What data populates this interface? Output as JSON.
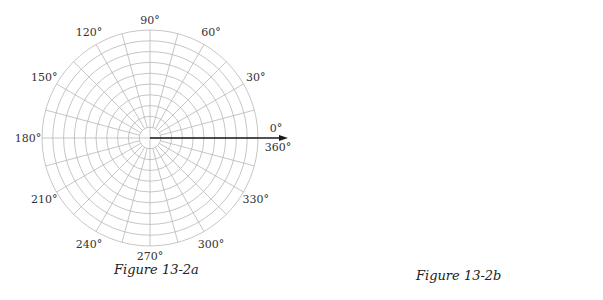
{
  "chart_data": [
    {
      "id": "fig-a",
      "type": "polar-line",
      "title": "Figure 13-2a",
      "center_px": [
        150,
        138
      ],
      "px_per_unit": 10.8,
      "rings": 10,
      "radial_step_deg": 15,
      "angle_labels": [
        "0°",
        "30°",
        "60°",
        "90°",
        "120°",
        "150°",
        "180°",
        "210°",
        "240°",
        "270°",
        "300°",
        "330°",
        "360°"
      ],
      "grid": true,
      "arrow_axis": "polar axis (0°)",
      "series": [
        {
          "name": "r = 10cos(theta)",
          "formula": "10*cos(t)",
          "a": 10,
          "kind": "circle",
          "points_deg": [
            0,
            15,
            30,
            45,
            60,
            75,
            90,
            285,
            300,
            315,
            330,
            345
          ],
          "r_values": [
            10,
            9.66,
            8.66,
            7.07,
            5.0,
            2.59,
            0,
            2.59,
            5.0,
            7.07,
            8.66,
            9.66
          ]
        },
        {
          "name": "r = 6cos(theta)",
          "formula": "6*cos(t)",
          "a": 6,
          "kind": "circle",
          "points_deg": [
            0,
            15,
            30,
            45,
            60,
            75,
            90,
            285,
            300,
            315,
            330,
            345
          ],
          "r_values": [
            6,
            5.8,
            5.2,
            4.24,
            3.0,
            1.55,
            0,
            1.55,
            3.0,
            4.24,
            5.2,
            5.8
          ]
        }
      ]
    },
    {
      "id": "fig-b",
      "type": "polar-line",
      "title": "Figure 13-2b",
      "center_px": [
        152,
        141
      ],
      "px_per_unit": 10.8,
      "rings": 10,
      "radial_step_deg": 15,
      "angle_labels": [
        "0°",
        "30°",
        "60°",
        "90°",
        "120°",
        "150°",
        "180°",
        "210°",
        "240°",
        "270°",
        "300°",
        "330°",
        "360°"
      ],
      "grid": true,
      "arrow_axis": "polar axis (0°)",
      "series": [
        {
          "name": "r = 9/(5 - 4cos(theta))",
          "formula": "9/(5-4*cos(t))",
          "kind": "ellipse",
          "points_deg": [
            0,
            15,
            30,
            45,
            60,
            75,
            90,
            105,
            120,
            135,
            150,
            165,
            180,
            195,
            210,
            225,
            240,
            255,
            270,
            285,
            300,
            315,
            330,
            345
          ],
          "r_values": [
            9.0,
            7.12,
            4.78,
            3.19,
            2.25,
            1.7,
            1.8,
            1.49,
            1.29,
            1.15,
            1.06,
            1.01,
            1.0,
            1.01,
            1.06,
            1.15,
            1.29,
            1.49,
            1.8,
            1.7,
            2.25,
            3.19,
            4.78,
            7.12
          ]
        }
      ]
    }
  ],
  "labels": {
    "caption_a": "Figure 13-2a",
    "caption_b": "Figure 13-2b"
  },
  "colors": {
    "grid": "#b8b8b8",
    "curve": "#3a3a3a",
    "axis": "#1a1a1a",
    "text": "#333333"
  }
}
